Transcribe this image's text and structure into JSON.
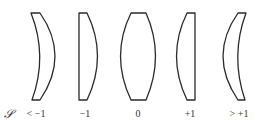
{
  "figure": {
    "symbol": "𝒮",
    "stroke_color": "#2a2a2a",
    "lenses": [
      {
        "name": "meniscus-negative",
        "label": "< −1"
      },
      {
        "name": "plano-convex-right",
        "label": "−1"
      },
      {
        "name": "biconvex",
        "label": "0"
      },
      {
        "name": "plano-convex-left",
        "label": "+1"
      },
      {
        "name": "meniscus-positive",
        "label": "> +1"
      }
    ]
  }
}
